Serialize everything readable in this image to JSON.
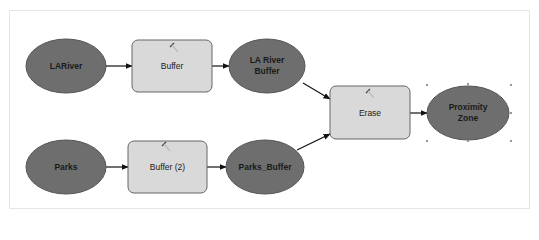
{
  "diagram": {
    "type": "model-builder",
    "colors": {
      "data_fill": "#6e6e6e",
      "data_stroke": "#555555",
      "tool_fill": "#d9d9d9",
      "tool_stroke": "#666666",
      "connector": "#111111"
    },
    "nodes": {
      "lariver": {
        "label": "LARiver",
        "kind": "input-data"
      },
      "buffer": {
        "label": "Buffer",
        "kind": "tool"
      },
      "la_river_buffer": {
        "label": "LA River Buffer",
        "line1": "LA River",
        "line2": "Buffer",
        "kind": "derived-data"
      },
      "parks": {
        "label": "Parks",
        "kind": "input-data"
      },
      "buffer2": {
        "label": "Buffer (2)",
        "kind": "tool"
      },
      "parks_buffer": {
        "label": "Parks_Buffer",
        "kind": "derived-data"
      },
      "erase": {
        "label": "Erase",
        "kind": "tool"
      },
      "proximity_zone": {
        "label": "Proximity Zone",
        "line1": "Proximity",
        "line2": "Zone",
        "kind": "output-data",
        "selected": true
      }
    },
    "edges": [
      {
        "from": "LARiver",
        "to": "Buffer"
      },
      {
        "from": "Buffer",
        "to": "LA River Buffer"
      },
      {
        "from": "Parks",
        "to": "Buffer (2)"
      },
      {
        "from": "Buffer (2)",
        "to": "Parks_Buffer"
      },
      {
        "from": "LA River Buffer",
        "to": "Erase"
      },
      {
        "from": "Parks_Buffer",
        "to": "Erase"
      },
      {
        "from": "Erase",
        "to": "Proximity Zone"
      }
    ]
  }
}
